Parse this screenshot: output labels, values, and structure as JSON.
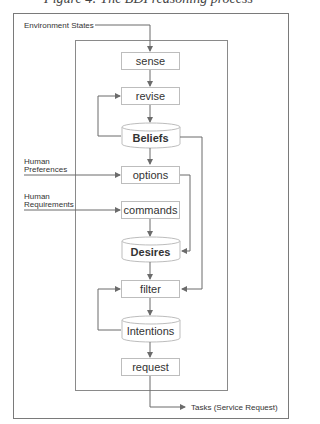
{
  "caption": "Figure 4: The BDI reasoning process",
  "inputs": {
    "environment_states": "Environment States",
    "human_preferences_line1": "Human",
    "human_preferences_line2": "Preferences",
    "human_requirements_line1": "Human",
    "human_requirements_line2": "Requirements"
  },
  "output": {
    "tasks": "Tasks (Service Request)"
  },
  "nodes": {
    "sense": "sense",
    "revise": "revise",
    "beliefs": "Beliefs",
    "options": "options",
    "commands": "commands",
    "desires": "Desires",
    "filter": "filter",
    "intentions": "Intentions",
    "request": "request"
  },
  "colors": {
    "line": "#6b6b6b",
    "box_border": "#bdbdbd",
    "frame": "#7a7a7a",
    "text": "#333333"
  }
}
